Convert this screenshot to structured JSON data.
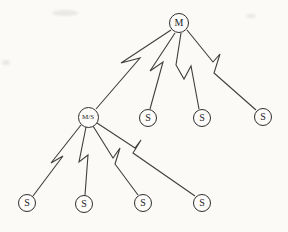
{
  "figure": {
    "background": "#fbfaf7",
    "line_color": "#3f3f3f",
    "node_border": "#2e2e2e",
    "node_fill": "#fdfcfa",
    "link_style": "lightning-bolt-wireless-link"
  },
  "nodes": [
    {
      "id": "m",
      "label": "M",
      "x": 179,
      "y": 23,
      "r": 10
    },
    {
      "id": "ms",
      "label": "M/S",
      "x": 88,
      "y": 117,
      "r": 10.5
    },
    {
      "id": "s1",
      "label": "S",
      "x": 148,
      "y": 118,
      "r": 9
    },
    {
      "id": "s2",
      "label": "S",
      "x": 202,
      "y": 118,
      "r": 9
    },
    {
      "id": "s3",
      "label": "S",
      "x": 263,
      "y": 117,
      "r": 9
    },
    {
      "id": "s4",
      "label": "S",
      "x": 27,
      "y": 203,
      "r": 9
    },
    {
      "id": "s5",
      "label": "S",
      "x": 84,
      "y": 204,
      "r": 9
    },
    {
      "id": "s6",
      "label": "S",
      "x": 143,
      "y": 203,
      "r": 9
    },
    {
      "id": "s7",
      "label": "S",
      "x": 202,
      "y": 203,
      "r": 9
    }
  ],
  "links": [
    {
      "from": "m",
      "to": "ms",
      "points": [
        [
          171,
          30
        ],
        [
          121,
          63
        ],
        [
          140,
          58
        ],
        [
          96,
          109
        ]
      ]
    },
    {
      "from": "m",
      "to": "s1",
      "points": [
        [
          175,
          33
        ],
        [
          150,
          71
        ],
        [
          163,
          62
        ],
        [
          150,
          109
        ]
      ]
    },
    {
      "from": "m",
      "to": "s2",
      "points": [
        [
          181,
          33
        ],
        [
          176,
          65
        ],
        [
          184,
          79
        ],
        [
          191,
          66
        ],
        [
          199,
          109
        ]
      ]
    },
    {
      "from": "m",
      "to": "s3",
      "points": [
        [
          187,
          30
        ],
        [
          213,
          62
        ],
        [
          220,
          54
        ],
        [
          214,
          73
        ],
        [
          256,
          110
        ]
      ]
    },
    {
      "from": "ms",
      "to": "s4",
      "points": [
        [
          81,
          125
        ],
        [
          51,
          163
        ],
        [
          63,
          156
        ],
        [
          33,
          196
        ]
      ]
    },
    {
      "from": "ms",
      "to": "s5",
      "points": [
        [
          86,
          127
        ],
        [
          79,
          162
        ],
        [
          88,
          155
        ],
        [
          85,
          195
        ]
      ]
    },
    {
      "from": "ms",
      "to": "s6",
      "points": [
        [
          93,
          126
        ],
        [
          113,
          158
        ],
        [
          120,
          148
        ],
        [
          115,
          164
        ],
        [
          138,
          195
        ]
      ]
    },
    {
      "from": "ms",
      "to": "s7",
      "points": [
        [
          97,
          123
        ],
        [
          135,
          148
        ],
        [
          141,
          140
        ],
        [
          133,
          153
        ],
        [
          195,
          196
        ]
      ]
    }
  ]
}
